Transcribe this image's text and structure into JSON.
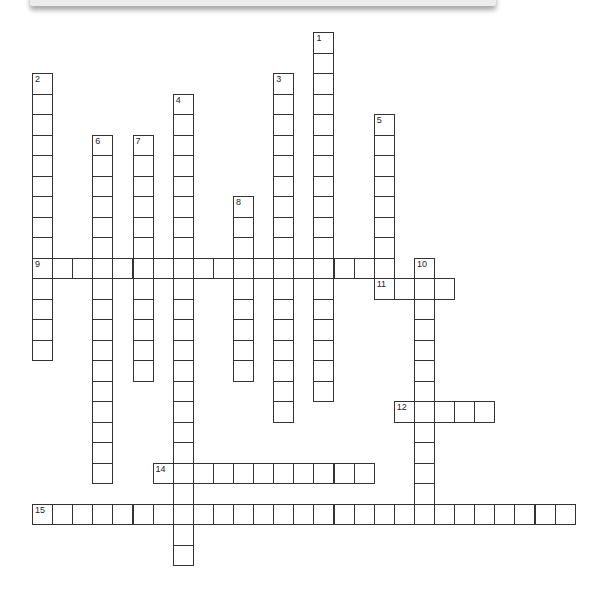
{
  "puzzle": {
    "type": "crossword",
    "grid": {
      "origin_x": 32,
      "origin_y": 32,
      "cell_w": 20.1,
      "cell_h": 20.5,
      "cols": 27,
      "rows": 26
    },
    "entries": [
      {
        "number": "1",
        "direction": "down",
        "col": 14,
        "row": 0,
        "length": 18
      },
      {
        "number": "2",
        "direction": "down",
        "col": 0,
        "row": 2,
        "length": 14
      },
      {
        "number": "3",
        "direction": "down",
        "col": 12,
        "row": 2,
        "length": 17
      },
      {
        "number": "4",
        "direction": "down",
        "col": 7,
        "row": 3,
        "length": 23
      },
      {
        "number": "5",
        "direction": "down",
        "col": 17,
        "row": 4,
        "length": 9
      },
      {
        "number": "6",
        "direction": "down",
        "col": 3,
        "row": 5,
        "length": 17
      },
      {
        "number": "7",
        "direction": "down",
        "col": 5,
        "row": 5,
        "length": 12
      },
      {
        "number": "8",
        "direction": "down",
        "col": 10,
        "row": 8,
        "length": 9
      },
      {
        "number": "9",
        "direction": "across",
        "col": 0,
        "row": 11,
        "length": 18
      },
      {
        "number": "10",
        "direction": "down",
        "col": 19,
        "row": 11,
        "length": 13
      },
      {
        "number": "11",
        "direction": "across",
        "col": 17,
        "row": 12,
        "length": 4
      },
      {
        "number": "12",
        "direction": "across",
        "col": 18,
        "row": 18,
        "length": 5
      },
      {
        "number": "14",
        "direction": "across",
        "col": 6,
        "row": 21,
        "length": 11
      },
      {
        "number": "15",
        "direction": "across",
        "col": 0,
        "row": 23,
        "length": 27
      }
    ]
  }
}
